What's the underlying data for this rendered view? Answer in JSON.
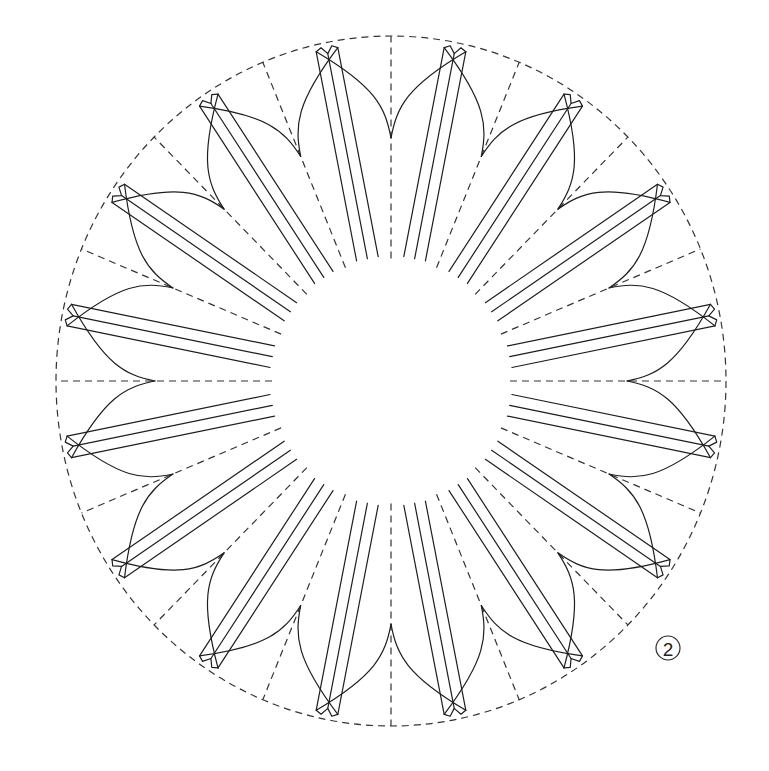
{
  "diagram": {
    "step_label": "2",
    "canvas": {
      "width": 769,
      "height": 771
    },
    "center": {
      "x": 391,
      "y": 381
    },
    "outer_radius": {
      "rx": 335,
      "ry": 345
    },
    "inner_radius": 119,
    "valley_radius": 236,
    "tip_radius": 328,
    "petal_count": 16,
    "petal_angle_offset_deg": 11.25,
    "fold_line_count": 3,
    "fold_line_spacing": 11,
    "colors": {
      "line": "#1e1e1e",
      "dash": "#333333",
      "background": "#ffffff"
    },
    "label": {
      "x": 668,
      "y": 648,
      "r": 12
    }
  }
}
